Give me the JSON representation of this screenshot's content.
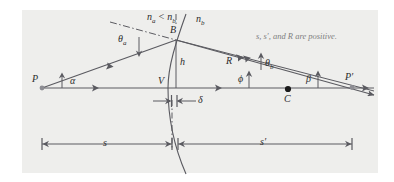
{
  "figure": {
    "background_color": "#eeeeec",
    "line_color": "#5a5a60",
    "text_color": "#2b2b2b",
    "note_color": "#7e7e80",
    "note": "s, s′, and R are positive."
  },
  "labels": {
    "object_point": "P",
    "image_point": "P′",
    "surface_point": "B",
    "vertex": "V",
    "center_of_curvature": "C",
    "index_comparison": "n",
    "index_comparison_sub_a": "a",
    "index_comparison_mid": " < n",
    "index_comparison_sub_b": "b",
    "index_b": "n",
    "index_b_sub": "b",
    "angle_theta_a": "θ",
    "angle_theta_a_sub": "a",
    "angle_theta_b": "θ",
    "angle_theta_b_sub": "b",
    "angle_alpha": "α",
    "angle_beta": "β",
    "angle_phi": "ϕ",
    "height": "h",
    "radius": "R",
    "delta": "δ",
    "object_distance": "s",
    "image_distance": "s′"
  },
  "geometry": {
    "axis_y": 88,
    "point_P": [
      42,
      88
    ],
    "point_B": [
      176,
      40
    ],
    "point_V": [
      168,
      88
    ],
    "point_C": [
      288,
      89
    ],
    "point_Pprime": [
      352,
      87
    ],
    "dim_s_from": 42,
    "dim_s_to": 172,
    "dim_sprime_from": 178,
    "dim_sprime_to": 352,
    "dim_y": 144
  }
}
